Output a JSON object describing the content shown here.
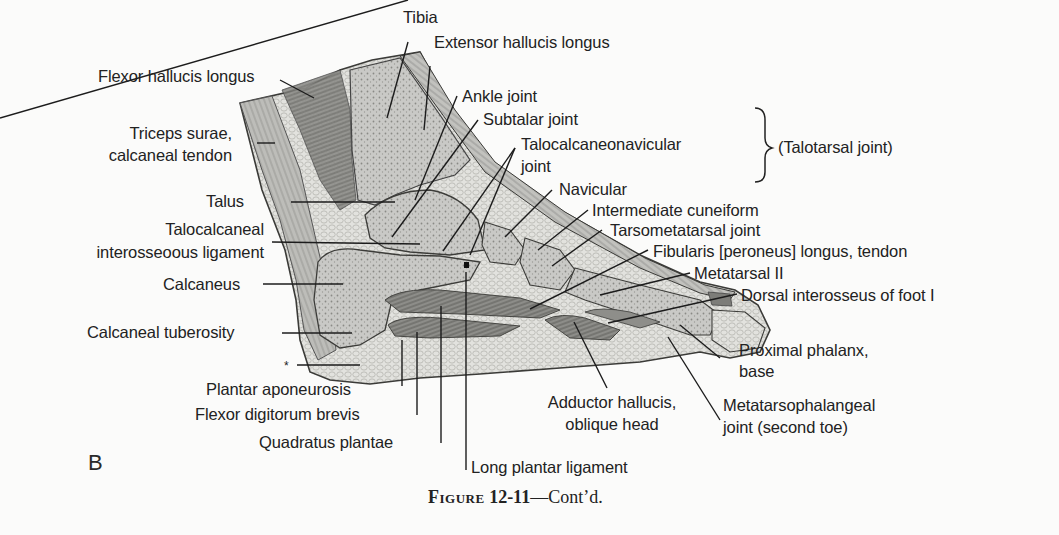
{
  "figure": {
    "panel_letter": "B",
    "caption_prefix": "Figure",
    "caption_number": "12-11",
    "caption_suffix": "—Cont’d."
  },
  "bracket_group": {
    "label": "(Talotarsal joint)",
    "members": [
      "Ankle joint",
      "Subtalar joint",
      "Talocalcaneonavicular joint"
    ]
  },
  "labels": {
    "tibia": "Tibia",
    "extensor_hallucis_longus": "Extensor hallucis longus",
    "flexor_hallucis_longus": "Flexor hallucis longus",
    "ankle_joint": "Ankle joint",
    "subtalar_joint": "Subtalar joint",
    "talocalcaneonavicular_joint_l1": "Talocalcaneonavicular",
    "talocalcaneonavicular_joint_l2": "joint",
    "triceps_surae_l1": "Triceps surae,",
    "triceps_surae_l2": "calcaneal tendon",
    "navicular": "Navicular",
    "talus": "Talus",
    "intermediate_cuneiform": "Intermediate cuneiform",
    "talocalcaneal_l1": "Talocalcaneal",
    "talocalcaneal_l2": "interosseoous ligament",
    "tarsometatarsal_joint": "Tarsometatarsal joint",
    "fibularis_longus": "Fibularis [peroneus] longus, tendon",
    "calcaneus": "Calcaneus",
    "metatarsal_ii": "Metatarsal II",
    "dorsal_interosseus": "Dorsal interosseus of foot I",
    "calcaneal_tuberosity": "Calcaneal tuberosity",
    "asterisk": "*",
    "proximal_phalanx_l1": "Proximal phalanx,",
    "proximal_phalanx_l2": "base",
    "plantar_aponeurosis": "Plantar aponeurosis",
    "flexor_digitorum_brevis": "Flexor digitorum brevis",
    "adductor_hallucis_l1": "Adductor hallucis,",
    "adductor_hallucis_l2": "oblique head",
    "metatarsophalangeal_l1": "Metatarsophalangeal",
    "metatarsophalangeal_l2": "joint (second toe)",
    "quadratus_plantae": "Quadratus plantae",
    "long_plantar_ligament": "Long plantar ligament"
  }
}
